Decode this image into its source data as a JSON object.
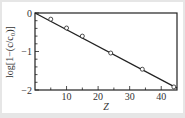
{
  "chart_data": {
    "type": "line",
    "title": "",
    "xlabel": "Z",
    "ylabel": "log[1−(c/c₀)]",
    "xlim": [
      0,
      45
    ],
    "ylim": [
      -2,
      0
    ],
    "xticks": [
      10,
      20,
      30,
      40
    ],
    "xtick_labels": [
      "10",
      "20",
      "30",
      "40"
    ],
    "yticks": [
      0,
      -1,
      -2
    ],
    "ytick_labels": [
      "0",
      "−1",
      "−2"
    ],
    "grid": false,
    "legend": null,
    "series": [
      {
        "name": "measured",
        "marker": "open-circle",
        "x": [
          5,
          10,
          15,
          24,
          34,
          44
        ],
        "y": [
          -0.16,
          -0.39,
          -0.6,
          -1.04,
          -1.46,
          -1.92
        ]
      },
      {
        "name": "linear fit",
        "marker": "none",
        "x": [
          0,
          45
        ],
        "y": [
          0,
          -1.95
        ]
      }
    ]
  },
  "colors": {
    "line": "#222222",
    "marker_fill": "#ffffff",
    "background": "#e6e6e6",
    "plot_bg": "#ffffff"
  }
}
